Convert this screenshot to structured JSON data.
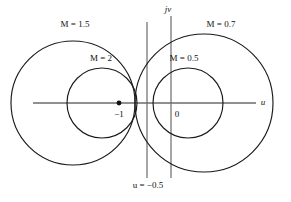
{
  "figure": {
    "axes": {
      "horizontal_label": "u",
      "vertical_label": "jv",
      "origin_label": "0",
      "critical_point_label": "−1"
    },
    "labels": {
      "m15": "M = 1.5",
      "m2": "M = 2",
      "m05": "M = 0.5",
      "m07": "M = 0.7",
      "vline": "u = −0.5"
    },
    "colors": {
      "curve": "#1a1a1a",
      "axis": "#6b6b6b",
      "text": "#111111",
      "background": "#ffffff"
    }
  },
  "chart_data": {
    "type": "scatter",
    "xlabel": "u",
    "ylabel": "jv",
    "xlim": [
      -3.05,
      1.95
    ],
    "ylim": [
      -1.95,
      1.95
    ],
    "grid": false,
    "legend": "inline-annotations",
    "units_per_pixel": 0.01923,
    "origin_px": [
      171,
      103
    ],
    "annotations": [
      {
        "text": "M = 1.5",
        "x_px": 75,
        "y_px": 26
      },
      {
        "text": "M = 2",
        "x_px": 100,
        "y_px": 60
      },
      {
        "text": "M = 0.7",
        "x_px": 220,
        "y_px": 26
      },
      {
        "text": "M = 0.5",
        "x_px": 183,
        "y_px": 60
      },
      {
        "text": "u = −0.5",
        "x_px": 147,
        "y_px": 186
      },
      {
        "text": "−1",
        "x_px": 119,
        "y_px": 115
      },
      {
        "text": "0",
        "x_px": 176,
        "y_px": 115
      },
      {
        "text": "u",
        "x_px": 262,
        "y_px": 102
      },
      {
        "text": "jv",
        "x_px": 168,
        "y_px": 10
      }
    ],
    "circles": [
      {
        "name": "M = 1.5",
        "M": 1.5,
        "center_u": -1.8,
        "radius": 1.2,
        "cx_px": 73,
        "cy_px": 103,
        "r_px": 62
      },
      {
        "name": "M = 2",
        "M": 2.0,
        "center_u": -1.333,
        "radius": 0.667,
        "cx_px": 102,
        "cy_px": 103,
        "r_px": 35
      },
      {
        "name": "M = 0.5",
        "M": 0.5,
        "center_u": 0.333,
        "radius": 0.667,
        "cx_px": 188,
        "cy_px": 103,
        "r_px": 35
      },
      {
        "name": "M = 0.7",
        "M": 0.7,
        "center_u": 0.961,
        "radius": 1.373,
        "cx_px": 204,
        "cy_px": 103,
        "r_px": 69
      }
    ],
    "lines": [
      {
        "name": "u = -0.5",
        "type": "vertical",
        "u": -0.5,
        "x_px": 147,
        "y0_px": 22,
        "y1_px": 178
      },
      {
        "name": "jv-axis",
        "type": "vertical",
        "u": 0.0,
        "x_px": 171,
        "y0_px": 16,
        "y1_px": 178
      },
      {
        "name": "u-axis",
        "type": "horizontal",
        "v": 0.0,
        "y_px": 103,
        "x0_px": 33,
        "x1_px": 256
      }
    ],
    "points": [
      {
        "name": "critical-point",
        "u": -1.0,
        "v": 0.0,
        "x_px": 119,
        "y_px": 103,
        "marker": "filled-dot"
      }
    ]
  }
}
